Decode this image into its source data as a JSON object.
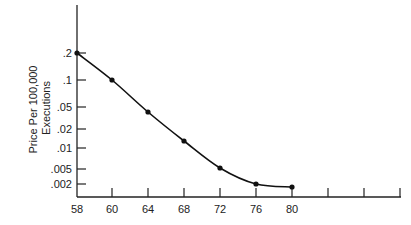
{
  "chart_data": {
    "type": "line",
    "title": "",
    "xlabel": "",
    "ylabel": "Price Per 100,000 Executions",
    "ylabel_lines": [
      "Price Per 100,000",
      "Executions"
    ],
    "yscale": "log",
    "x": [
      58,
      60,
      64,
      68,
      72,
      76,
      80
    ],
    "values": [
      0.2,
      0.1,
      0.04,
      0.013,
      0.005,
      0.0022,
      0.002
    ],
    "x_tick_labels": [
      "58",
      "60",
      "64",
      "68",
      "72",
      "76",
      "80"
    ],
    "y_tick_labels": [
      ".2",
      ".1",
      ".05",
      ".02",
      ".01",
      ".005",
      ".002"
    ],
    "grid": false,
    "legend": null
  }
}
